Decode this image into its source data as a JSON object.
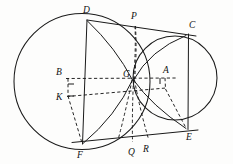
{
  "figure": {
    "type": "geometric-diagram",
    "canvas": {
      "width": 233,
      "height": 164
    },
    "ink_color": "#1a1a1a",
    "background_color": "#fdfdfc"
  },
  "circles": [
    {
      "name": "large-circle",
      "center_label": "B",
      "cx": 82,
      "cy": 81.5,
      "r": 68,
      "style": "solid"
    },
    {
      "name": "small-circle",
      "center_label": "A",
      "cx": 175,
      "cy": 78,
      "r": 42,
      "style": "solid"
    }
  ],
  "points": {
    "A": {
      "label": "A",
      "x": 164.5,
      "y": 78,
      "label_x": 165,
      "label_y": 72
    },
    "B": {
      "label": "B",
      "x": 68,
      "y": 78,
      "label_x": 58,
      "label_y": 74
    },
    "C": {
      "label": "C",
      "x": 188,
      "y": 34,
      "label_x": 189,
      "label_y": 28
    },
    "D": {
      "label": "D",
      "x": 87,
      "y": 20,
      "label_x": 85,
      "label_y": 13
    },
    "E": {
      "label": "E",
      "x": 188,
      "y": 129,
      "label_x": 187,
      "label_y": 140
    },
    "F": {
      "label": "F",
      "x": 82,
      "y": 144,
      "label_x": 79,
      "label_y": 157
    },
    "G": {
      "label": "G",
      "x": 133,
      "y": 80,
      "label_x": 124,
      "label_y": 76
    },
    "K": {
      "label": "K",
      "x": 68,
      "y": 96,
      "label_x": 58,
      "label_y": 99
    },
    "P": {
      "label": "P",
      "x": 135,
      "y": 26,
      "label_x": 133,
      "label_y": 19
    },
    "Q": {
      "label": "Q",
      "x": 133,
      "y": 143,
      "label_x": 130,
      "label_y": 155
    },
    "R": {
      "label": "R",
      "x": 148,
      "y": 140,
      "label_x": 145,
      "label_y": 152
    }
  },
  "segments": [
    {
      "name": "tangent-DC",
      "from": "D",
      "to": "C",
      "style": "solid"
    },
    {
      "name": "tangent-FE",
      "from": "F",
      "to": "E",
      "style": "solid"
    },
    {
      "name": "chord-DF",
      "from": "D",
      "to": "F",
      "style": "solid"
    },
    {
      "name": "chord-CE",
      "from": "C",
      "to": "E",
      "style": "solid"
    },
    {
      "name": "segment-DG",
      "from": "D",
      "to": "G",
      "style": "solid"
    },
    {
      "name": "segment-GF",
      "from": "G",
      "to": "F",
      "style": "solid"
    },
    {
      "name": "segment-PG",
      "from": "P",
      "to": "G",
      "style": "dashed"
    },
    {
      "name": "segment-GE",
      "from": "G",
      "to": "E",
      "style": "solid"
    },
    {
      "name": "segment-PQ",
      "from": "P",
      "to": "Q",
      "style": "dashed"
    },
    {
      "name": "segment-BA",
      "from": "B",
      "to": "A",
      "style": "dashed"
    },
    {
      "name": "segment-KA",
      "from": "K",
      "to": "A",
      "style": "dashed"
    },
    {
      "name": "segment-BK",
      "from": "B",
      "to": "K",
      "style": "dashed"
    },
    {
      "name": "segment-KF",
      "from": "K",
      "to": "F",
      "style": "dashed"
    },
    {
      "name": "segment-AE",
      "from": "A",
      "to": "E",
      "style": "dashed"
    },
    {
      "name": "segment-GR",
      "from": "G",
      "to": "R",
      "style": "solid"
    }
  ],
  "labels": [
    "A",
    "B",
    "C",
    "D",
    "E",
    "F",
    "G",
    "K",
    "P",
    "Q",
    "R"
  ]
}
